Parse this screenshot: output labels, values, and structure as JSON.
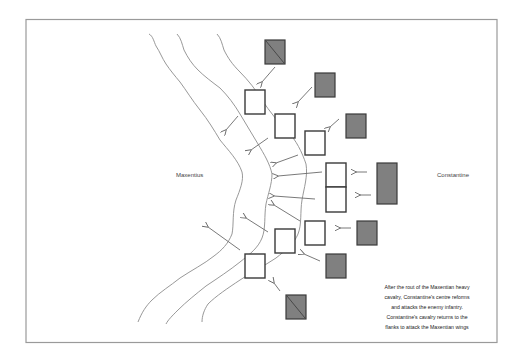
{
  "diagram": {
    "labels": {
      "left_army": "Maxentius",
      "right_army": "Constantine"
    },
    "caption_lines": [
      "After the rout of the Maxentian heavy",
      "cavalry, Constantine's centre reforms",
      "and attacks the enemy infantry.",
      "Constantine's cavalry returns to the",
      "flanks to attack the Maxentian wings"
    ],
    "colors": {
      "cavalry_fill": "#808080",
      "infantry_fill": "#ffffff",
      "outline": "#3a3a3a",
      "river": "#8c8c8c",
      "arrow": "#6a6a6a"
    },
    "legend_semantics": {
      "white_box": "infantry unit",
      "grey_box": "cavalry unit",
      "grey_box_with_diagonal": "cavalry unit (flank)",
      "wavy_lines": "river / terrain lines",
      "arrows": "direction of movement/attack"
    }
  }
}
